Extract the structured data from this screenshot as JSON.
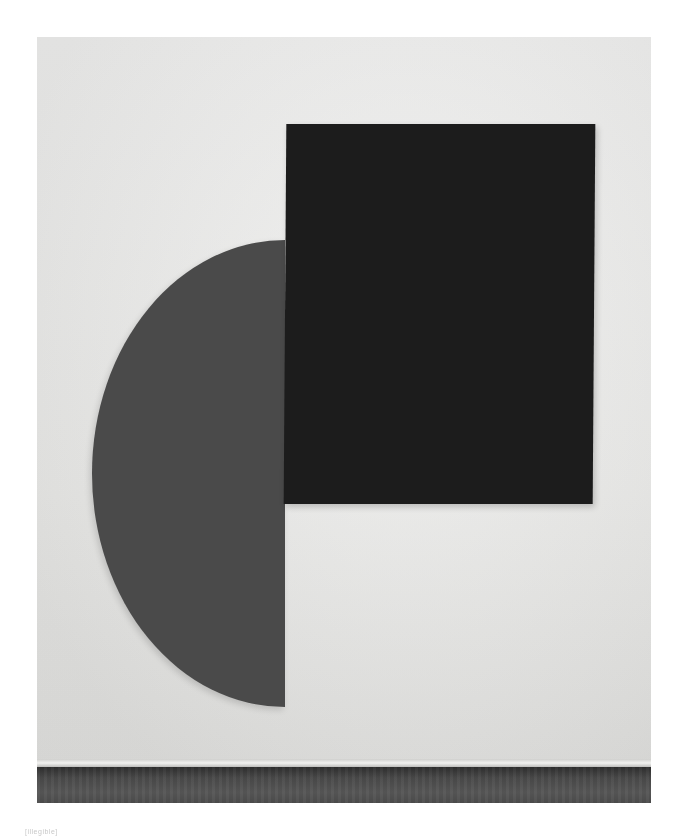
{
  "image": {
    "subject": "Two-panel abstract painting on a gallery wall",
    "elements": [
      {
        "name": "half-disc-panel",
        "shape": "half-circle",
        "color": "#4a4a4a"
      },
      {
        "name": "black-rectangle-panel",
        "shape": "rectangle",
        "color": "#1c1c1c"
      }
    ],
    "wall_color": "#e8e8e6",
    "floor_color": "#4a4a4a"
  },
  "caption": {
    "text": "[illegible]"
  }
}
